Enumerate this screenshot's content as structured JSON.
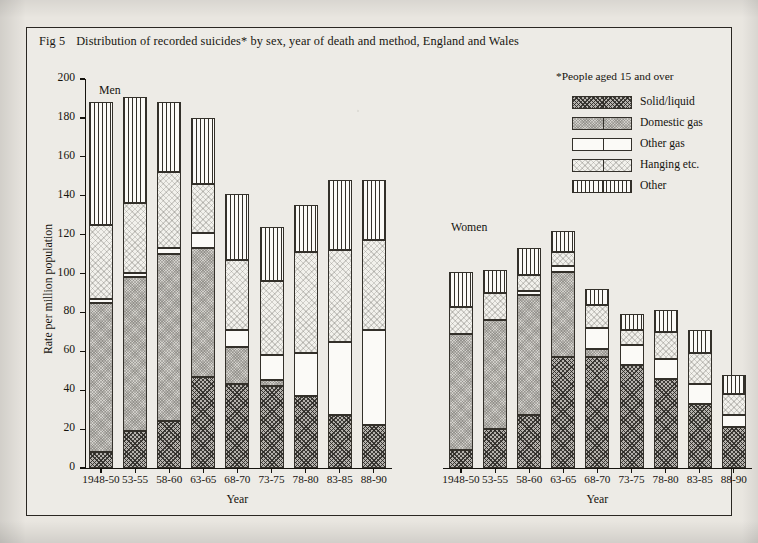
{
  "figure": {
    "number": "Fig 5",
    "title": "Distribution of recorded suicides* by sex, year of death and method, England and Wales",
    "footnote": "*People aged 15 and over"
  },
  "axes": {
    "ylabel": "Rate per million population",
    "xlabel": "Year",
    "ytick_labels": [
      "0",
      "20",
      "40",
      "60",
      "80",
      "100",
      "120",
      "140",
      "160",
      "180",
      "200"
    ],
    "ymin": 0,
    "ymax": 200
  },
  "panels": {
    "men": {
      "label": "Men"
    },
    "women": {
      "label": "Women"
    }
  },
  "legend": {
    "items": [
      {
        "label": "Solid/liquid",
        "key": "solid",
        "swatch": "cross-hatch-dark"
      },
      {
        "label": "Domestic gas",
        "key": "domestic",
        "swatch": "grey-fill"
      },
      {
        "label": "Other gas",
        "key": "othergas",
        "swatch": "white-fill"
      },
      {
        "label": "Hanging etc.",
        "key": "hanging",
        "swatch": "light-stipple"
      },
      {
        "label": "Other",
        "key": "other",
        "swatch": "vertical-lines"
      }
    ]
  },
  "chart_data": {
    "type": "bar",
    "stacked": true,
    "title": "Distribution of recorded suicides* by sex, year of death and method, England and Wales",
    "xlabel": "Year",
    "ylabel": "Rate per million population",
    "ylim": [
      0,
      200
    ],
    "ytick_step": 20,
    "grid": false,
    "legend_position": "top-right",
    "categories": [
      "1948-50",
      "53-55",
      "58-60",
      "63-65",
      "68-70",
      "73-75",
      "78-80",
      "83-85",
      "88-90"
    ],
    "panels": [
      {
        "name": "Men",
        "series": [
          {
            "name": "Solid/liquid",
            "values": [
              8,
              19,
              24,
              47,
              43,
              42,
              37,
              27,
              22
            ]
          },
          {
            "name": "Domestic gas",
            "values": [
              77,
              79,
              86,
              66,
              19,
              3,
              0,
              0,
              0
            ]
          },
          {
            "name": "Other gas",
            "values": [
              2,
              2,
              3,
              8,
              9,
              13,
              22,
              38,
              49
            ]
          },
          {
            "name": "Hanging etc.",
            "values": [
              38,
              36,
              39,
              25,
              36,
              38,
              52,
              47,
              46
            ]
          },
          {
            "name": "Other",
            "values": [
              63,
              55,
              36,
              34,
              34,
              28,
              24,
              36,
              31
            ]
          }
        ],
        "totals": [
          188,
          191,
          188,
          180,
          141,
          124,
          135,
          148,
          148
        ]
      },
      {
        "name": "Women",
        "series": [
          {
            "name": "Solid/liquid",
            "values": [
              9,
              20,
              27,
              57,
              57,
              53,
              46,
              33,
              21
            ]
          },
          {
            "name": "Domestic gas",
            "values": [
              60,
              56,
              62,
              44,
              4,
              0,
              0,
              0,
              0
            ]
          },
          {
            "name": "Other gas",
            "values": [
              0,
              0,
              2,
              3,
              11,
              10,
              10,
              10,
              6
            ]
          },
          {
            "name": "Hanging etc.",
            "values": [
              14,
              14,
              8,
              7,
              12,
              8,
              14,
              16,
              11
            ]
          },
          {
            "name": "Other",
            "values": [
              18,
              12,
              14,
              11,
              8,
              8,
              11,
              12,
              10
            ]
          }
        ],
        "totals": [
          101,
          102,
          113,
          122,
          92,
          79,
          81,
          71,
          48
        ]
      }
    ]
  }
}
